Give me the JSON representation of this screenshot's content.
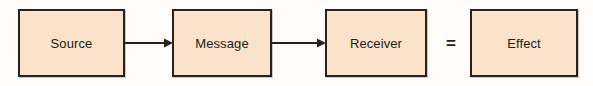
{
  "diagram": {
    "type": "linear-flow",
    "background_color": "#fdfcfb",
    "node_fill_color": "#fae2cb",
    "node_border_color": "#2b211a",
    "text_color": "#231c16",
    "nodes": [
      {
        "id": "source",
        "label": "Source"
      },
      {
        "id": "message",
        "label": "Message"
      },
      {
        "id": "receiver",
        "label": "Receiver"
      },
      {
        "id": "effect",
        "label": "Effect"
      }
    ],
    "connectors": [
      {
        "id": "source-to-message",
        "from": "source",
        "to": "message",
        "kind": "arrow",
        "glyph_name": "arrow-right-icon"
      },
      {
        "id": "message-to-receiver",
        "from": "message",
        "to": "receiver",
        "kind": "arrow",
        "glyph_name": "arrow-right-icon"
      }
    ],
    "operators": [
      {
        "id": "equals",
        "symbol": "=",
        "glyph_name": "equals-icon",
        "between": [
          "receiver",
          "effect"
        ]
      }
    ]
  }
}
